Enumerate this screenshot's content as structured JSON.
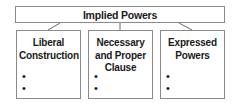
{
  "diagram": {
    "root": {
      "label": "Implied Powers"
    },
    "children": [
      {
        "label_lines": [
          "Liberal",
          "Construction"
        ],
        "bullets": [
          "",
          ""
        ]
      },
      {
        "label_lines": [
          "Necessary",
          "and Proper",
          "Clause"
        ],
        "bullets": [
          "",
          ""
        ]
      },
      {
        "label_lines": [
          "Expressed",
          "Powers"
        ],
        "bullets": [
          "",
          ""
        ]
      }
    ],
    "colors": {
      "border": "#8a8a8a",
      "text": "#1a1a1a",
      "background": "#ffffff"
    }
  }
}
